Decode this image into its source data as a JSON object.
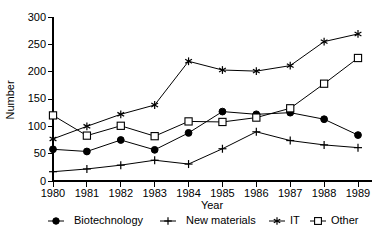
{
  "chart_data": {
    "type": "line",
    "title": "",
    "xlabel": "Year",
    "ylabel": "Number",
    "categories": [
      "1980",
      "1981",
      "1982",
      "1983",
      "1984",
      "1985",
      "1986",
      "1987",
      "1988",
      "1989"
    ],
    "x": [
      1980,
      1981,
      1982,
      1983,
      1984,
      1985,
      1986,
      1987,
      1988,
      1989
    ],
    "xlim": [
      1980,
      1989
    ],
    "ylim": [
      0,
      300
    ],
    "yticks": [
      0,
      50,
      100,
      150,
      200,
      250,
      300
    ],
    "ytick_labels": [
      "0",
      "50",
      "100",
      "150",
      "200",
      "250",
      "300"
    ],
    "grid": false,
    "legend_position": "bottom",
    "series": [
      {
        "name": "Biotechnology",
        "marker": "filled-circle",
        "color": "#000000",
        "values": [
          58,
          54,
          75,
          57,
          88,
          127,
          122,
          125,
          113,
          84
        ]
      },
      {
        "name": "New materials",
        "marker": "plus",
        "color": "#000000",
        "values": [
          17,
          22,
          29,
          38,
          31,
          59,
          90,
          74,
          66,
          61
        ]
      },
      {
        "name": "IT",
        "marker": "star",
        "color": "#000000",
        "values": [
          77,
          100,
          122,
          139,
          219,
          203,
          201,
          211,
          255,
          269
        ]
      },
      {
        "name": "Other",
        "marker": "open-square",
        "color": "#000000",
        "values": [
          120,
          83,
          101,
          82,
          109,
          108,
          116,
          133,
          178,
          225
        ]
      }
    ]
  },
  "axes": {
    "y_label": "Number",
    "x_label": "Year",
    "y_tick_0": "0",
    "y_tick_1": "50",
    "y_tick_2": "100",
    "y_tick_3": "150",
    "y_tick_4": "200",
    "y_tick_5": "250",
    "y_tick_6": "300",
    "x_tick_0": "1980",
    "x_tick_1": "1981",
    "x_tick_2": "1982",
    "x_tick_3": "1983",
    "x_tick_4": "1984",
    "x_tick_5": "1985",
    "x_tick_6": "1986",
    "x_tick_7": "1987",
    "x_tick_8": "1988",
    "x_tick_9": "1989"
  },
  "legend": {
    "items": [
      {
        "label": "Biotechnology",
        "marker": "filled-circle"
      },
      {
        "label": "New materials",
        "marker": "plus"
      },
      {
        "label": "IT",
        "marker": "star"
      },
      {
        "label": "Other",
        "marker": "open-square"
      }
    ]
  }
}
